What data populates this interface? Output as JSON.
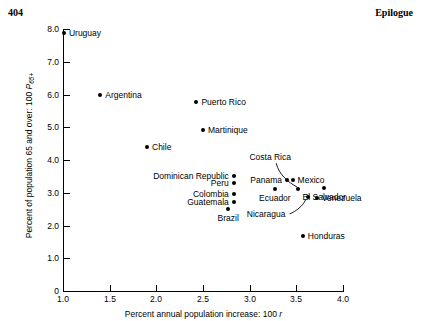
{
  "page": {
    "folio": "404",
    "running_title": "Epilogue"
  },
  "chart_data": {
    "type": "scatter",
    "title": "",
    "xlabel": "Percent annual population increase: 100 r",
    "ylabel": "Percent of population 65 and over: 100 P65+",
    "xlim": [
      1.0,
      4.0
    ],
    "ylim": [
      0,
      8.0
    ],
    "xticks": [
      "1.0",
      "1.5",
      "2.0",
      "2.5",
      "3.0",
      "3.5",
      "4.0"
    ],
    "xtick_values": [
      1.0,
      1.5,
      2.0,
      2.5,
      3.0,
      3.5,
      4.0
    ],
    "yticks": [
      "0",
      "1.0",
      "2.0",
      "3.0",
      "4.0",
      "5.0",
      "6.0",
      "7.0",
      "8.0"
    ],
    "ytick_values": [
      0,
      1.0,
      2.0,
      3.0,
      4.0,
      5.0,
      6.0,
      7.0,
      8.0
    ],
    "grid": false,
    "legend": "none",
    "points": [
      {
        "name": "Uruguay",
        "x": 1.01,
        "y": 7.88,
        "label_pos": "right"
      },
      {
        "name": "Argentina",
        "x": 1.4,
        "y": 6.0,
        "label_pos": "right"
      },
      {
        "name": "Puerto Rico",
        "x": 2.43,
        "y": 5.76,
        "label_pos": "right"
      },
      {
        "name": "Martinique",
        "x": 2.5,
        "y": 4.92,
        "label_pos": "right"
      },
      {
        "name": "Chile",
        "x": 1.9,
        "y": 4.41,
        "label_pos": "right"
      },
      {
        "name": "Dominican Republic",
        "x": 2.83,
        "y": 3.52,
        "label_pos": "left"
      },
      {
        "name": "Peru",
        "x": 2.83,
        "y": 3.29,
        "label_pos": "left"
      },
      {
        "name": "Colombia",
        "x": 2.83,
        "y": 2.96,
        "label_pos": "left"
      },
      {
        "name": "Guatemala",
        "x": 2.83,
        "y": 2.72,
        "label_pos": "left"
      },
      {
        "name": "Brazil",
        "x": 2.77,
        "y": 2.51,
        "label_pos": "below"
      },
      {
        "name": "Ecuador",
        "x": 3.27,
        "y": 3.12,
        "label_pos": "below"
      },
      {
        "name": "Panama",
        "x": 3.4,
        "y": 3.4,
        "label_pos": "left"
      },
      {
        "name": "Mexico",
        "x": 3.46,
        "y": 3.4,
        "label_pos": "right"
      },
      {
        "name": "Costa Rica",
        "x": 3.52,
        "y": 3.11,
        "label_pos": "leader-above"
      },
      {
        "name": "Nicaragua",
        "x": 3.62,
        "y": 2.87,
        "label_pos": "leader-below"
      },
      {
        "name": "Venezuela",
        "x": 3.72,
        "y": 2.84,
        "label_pos": "right"
      },
      {
        "name": "El Salvador",
        "x": 3.8,
        "y": 3.15,
        "label_pos": "below"
      },
      {
        "name": "Honduras",
        "x": 3.57,
        "y": 1.68,
        "label_pos": "right"
      }
    ]
  }
}
